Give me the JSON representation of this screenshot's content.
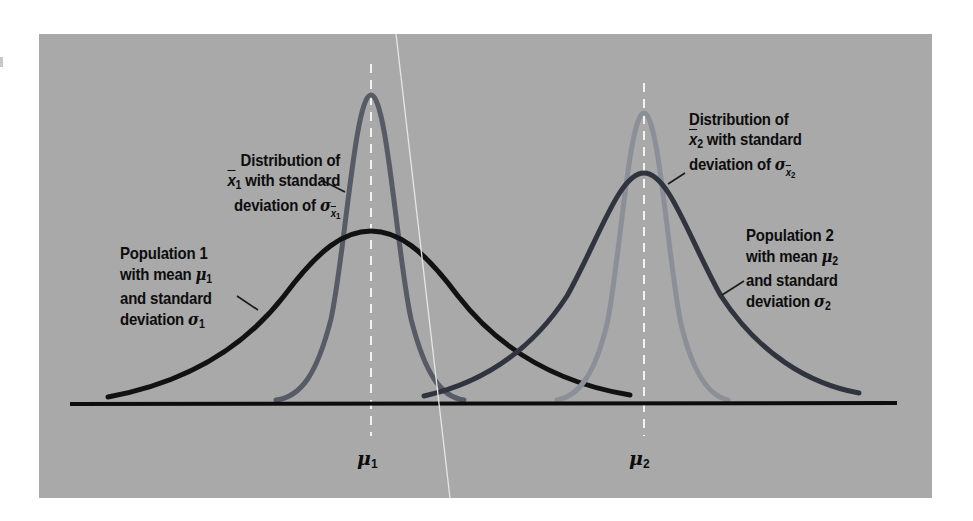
{
  "diagram": {
    "type": "normal-distributions-comparison",
    "colors": {
      "background_panel": "#a9a9a9",
      "page": "#ffffff",
      "baseline": "#0d0d0d",
      "population1_curve": "#121212",
      "population2_curve": "#30343e",
      "sampling1_curve": "#575b66",
      "sampling2_curve": "#8b8f97",
      "mean_line": "#f2f2f2",
      "scratch_line": "#e6e6e6"
    },
    "labels": {
      "sampling1": {
        "line1": "Distribution of",
        "line2_symbol": "x",
        "line2_sub": "1",
        "line2_text": " with standard",
        "line3_text": "deviation of ",
        "line3_symbol": "σ",
        "line3_sub_symbol": "x",
        "line3_sub_sub": "1"
      },
      "sampling2": {
        "line1": "Distribution of",
        "line2_symbol": "x",
        "line2_sub": "2",
        "line2_text": " with standard",
        "line3_text": "deviation of ",
        "line3_symbol": "σ",
        "line3_sub_symbol": "x",
        "line3_sub_sub": "2"
      },
      "population1": {
        "line1": "Population 1",
        "line2_text": "with mean ",
        "line2_symbol": "μ",
        "line2_sub": "1",
        "line3_text": "and standard",
        "line4_text": "deviation ",
        "line4_symbol": "σ",
        "line4_sub": "1"
      },
      "population2": {
        "line1": "Population 2",
        "line2_text": "with mean ",
        "line2_symbol": "μ",
        "line2_sub": "2",
        "line3_text": "and standard",
        "line4_text": "deviation ",
        "line4_symbol": "σ",
        "line4_sub": "2"
      }
    },
    "axis_labels": {
      "mu1": {
        "symbol": "μ",
        "sub": "1"
      },
      "mu2": {
        "symbol": "μ",
        "sub": "2"
      }
    },
    "curves": [
      {
        "name": "Population 1",
        "mean_label": "μ1",
        "relative_spread": "wide",
        "peak_height": "low"
      },
      {
        "name": "Sampling distribution of x̄1",
        "mean_label": "μ1",
        "relative_spread": "narrow",
        "peak_height": "high"
      },
      {
        "name": "Population 2",
        "mean_label": "μ2",
        "relative_spread": "wide",
        "peak_height": "medium"
      },
      {
        "name": "Sampling distribution of x̄2",
        "mean_label": "μ2",
        "relative_spread": "narrow",
        "peak_height": "high"
      }
    ]
  }
}
